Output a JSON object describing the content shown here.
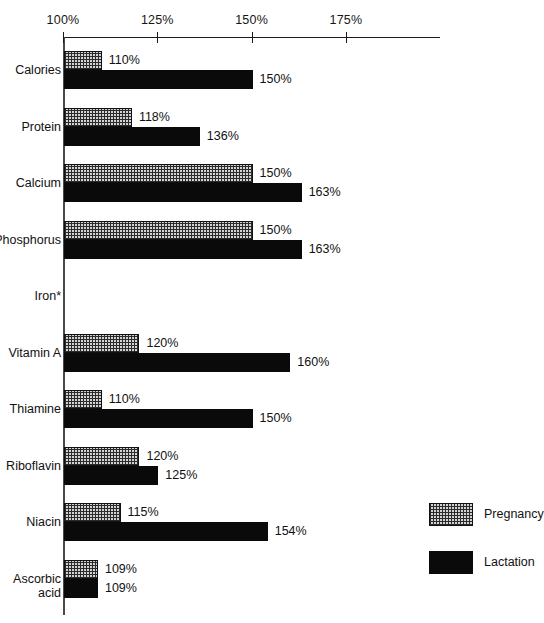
{
  "chart_data": {
    "type": "bar",
    "orientation": "horizontal",
    "title": "",
    "xlabel": "",
    "ylabel": "",
    "xlim": [
      100,
      200
    ],
    "grid": false,
    "legend_position": "bottom-right",
    "tick_labels": [
      "100%",
      "125%",
      "150%",
      "175%"
    ],
    "tick_values": [
      100,
      125,
      150,
      175
    ],
    "categories": [
      "Calories",
      "Protein",
      "Calcium",
      "Phosphorus",
      "Iron*",
      "Vitamin A",
      "Thiamine",
      "Riboflavin",
      "Niacin",
      "Ascorbic\nacid"
    ],
    "series": [
      {
        "name": "Pregnancy",
        "color": "#d3d3d3",
        "pattern": "checker",
        "values": [
          110,
          118,
          150,
          150,
          100,
          120,
          110,
          120,
          115,
          109
        ],
        "labels": [
          "110%",
          "118%",
          "150%",
          "150%",
          "",
          "120%",
          "110%",
          "120%",
          "115%",
          "109%"
        ]
      },
      {
        "name": "Lactation",
        "color": "#0a0a0a",
        "pattern": "solid",
        "values": [
          150,
          136,
          163,
          163,
          100,
          160,
          150,
          125,
          154,
          109
        ],
        "labels": [
          "150%",
          "136%",
          "163%",
          "163%",
          "",
          "160%",
          "150%",
          "125%",
          "154%",
          "109%"
        ]
      }
    ],
    "footnote_marker": "*"
  },
  "axis": {
    "ticks": [
      {
        "label": "100%",
        "value": 100
      },
      {
        "label": "125%",
        "value": 125
      },
      {
        "label": "150%",
        "value": 150
      },
      {
        "label": "175%",
        "value": 175
      }
    ]
  },
  "rows": [
    {
      "label": "Calories",
      "preg_label": "110%",
      "preg_value": 110,
      "lact_label": "150%",
      "lact_value": 150
    },
    {
      "label": "Protein",
      "preg_label": "118%",
      "preg_value": 118,
      "lact_label": "136%",
      "lact_value": 136
    },
    {
      "label": "Calcium",
      "preg_label": "150%",
      "preg_value": 150,
      "lact_label": "163%",
      "lact_value": 163
    },
    {
      "label": "Phosphorus",
      "preg_label": "150%",
      "preg_value": 150,
      "lact_label": "163%",
      "lact_value": 163
    },
    {
      "label": "Iron*",
      "preg_label": "",
      "preg_value": 100,
      "lact_label": "",
      "lact_value": 100
    },
    {
      "label": "Vitamin A",
      "preg_label": "120%",
      "preg_value": 120,
      "lact_label": "160%",
      "lact_value": 160
    },
    {
      "label": "Thiamine",
      "preg_label": "110%",
      "preg_value": 110,
      "lact_label": "150%",
      "lact_value": 150
    },
    {
      "label": "Riboflavin",
      "preg_label": "120%",
      "preg_value": 120,
      "lact_label": "125%",
      "lact_value": 125
    },
    {
      "label": "Niacin",
      "preg_label": "115%",
      "preg_value": 115,
      "lact_label": "154%",
      "lact_value": 154
    },
    {
      "label": "Ascorbic\nacid",
      "preg_label": "109%",
      "preg_value": 109,
      "lact_label": "109%",
      "lact_value": 109
    }
  ],
  "legend": {
    "items": [
      {
        "label": "Pregnancy",
        "style": "checker"
      },
      {
        "label": "Lactation",
        "style": "solid"
      }
    ]
  }
}
